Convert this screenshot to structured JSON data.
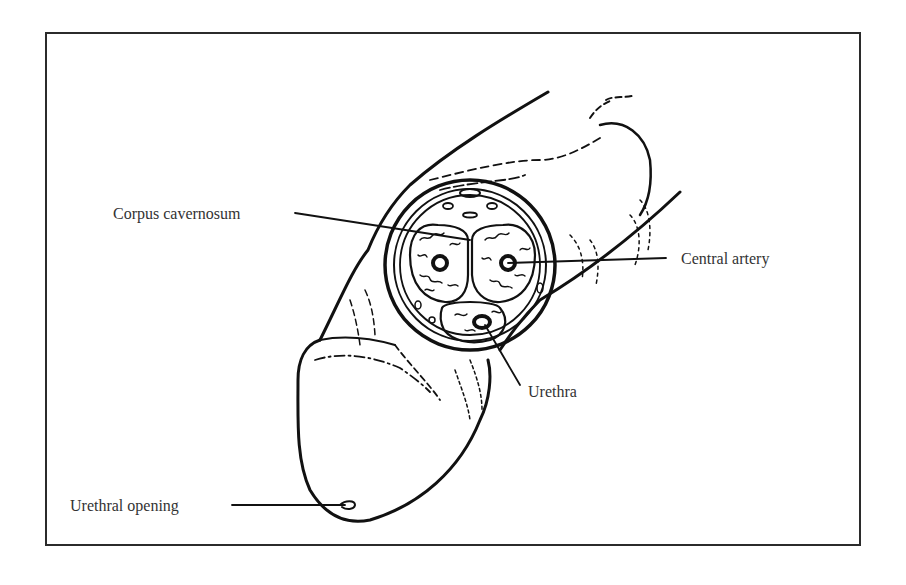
{
  "figure": {
    "type": "anatomical-illustration",
    "labels": {
      "corpus_cavernosum": "Corpus cavernosum",
      "central_artery": "Central artery",
      "urethra": "Urethra",
      "urethral_opening": "Urethral opening"
    },
    "colors": {
      "ink": "#111111",
      "text": "#333333",
      "frame": "#2b2b2b",
      "background": "#ffffff"
    }
  }
}
